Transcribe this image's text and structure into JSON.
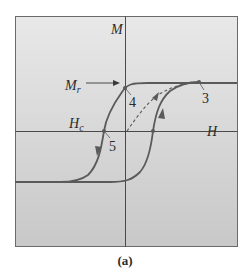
{
  "figure": {
    "caption": "(a)",
    "axes": {
      "vertical_label": "M",
      "horizontal_label": "H"
    },
    "annotations": {
      "remanence_label": "M",
      "remanence_subscript": "r",
      "coercivity_label": "H",
      "coercivity_subscript": "c"
    },
    "points": [
      {
        "id": "3",
        "label": "3",
        "description": "saturation point"
      },
      {
        "id": "4",
        "label": "4",
        "description": "remanent magnetization M_r"
      },
      {
        "id": "5",
        "label": "5",
        "description": "coercive field H_c"
      }
    ],
    "colors": {
      "background_top": "#e6e6e6",
      "background_bottom": "#c9c9c9",
      "curve": "#5a5a5a",
      "axis": "#3a3a3a",
      "frame": "#6a6a6a"
    }
  }
}
